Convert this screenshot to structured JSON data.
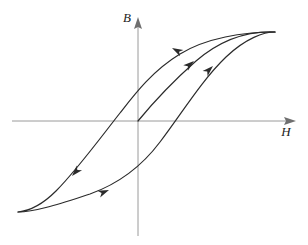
{
  "figure": {
    "kind": "diagram",
    "title_visible": false,
    "background_color": "#ffffff",
    "curve_color": "#2b2b2b",
    "axis_color": "#9a9a9a",
    "label_color": "#222222",
    "curve_width": 1.2,
    "axis_width": 1.0
  },
  "axes": {
    "origin": {
      "x": 138,
      "y": 121
    },
    "horizontal": {
      "name": "H",
      "label": "H",
      "label_position": {
        "x": 286,
        "y": 135
      },
      "start": {
        "x": 12,
        "y": 121
      },
      "end": {
        "x": 296,
        "y": 121
      },
      "arrow_at": "end"
    },
    "vertical": {
      "name": "B",
      "label": "B",
      "label_position": {
        "x": 127,
        "y": 22
      },
      "start": {
        "x": 138,
        "y": 236
      },
      "end": {
        "x": 138,
        "y": 17
      },
      "arrow_at": "end"
    }
  },
  "chart_data": {
    "type": "line",
    "title": "",
    "xlabel": "H",
    "ylabel": "B",
    "grid": false,
    "legend": false,
    "saturation_points": {
      "positive": {
        "x": 275,
        "y": 32
      },
      "negative": {
        "x": 18,
        "y": 212
      }
    },
    "remanence_crossing_b_axis": {
      "x": 138,
      "y": 78
    },
    "coercivity_crossing_h_axis": {
      "x": 111,
      "y": 121
    },
    "ascending_crossing_h_axis": {
      "x": 166,
      "y": 121
    },
    "ascending_crossing_b_axis": {
      "x": 138,
      "y": 163
    },
    "series": [
      {
        "name": "initial-magnetization-curve",
        "path": "M 138 121 C 152 104, 170 84, 196 61 C 224 37, 253 31, 275 32"
      },
      {
        "name": "descending-branch",
        "path": "M 275 32 C 243 32, 206 38, 180 54 C 152 71, 134 95, 120 113 C 98 141, 76 171, 56 191 C 42 205, 28 211, 18 212"
      },
      {
        "name": "ascending-branch",
        "path": "M 18 212 C 36 212, 62 203, 90 194 C 118 184, 142 166, 160 142 C 182 113, 202 80, 226 57 C 246 38, 264 32, 275 32"
      }
    ],
    "arrows": [
      {
        "name": "arrow-descending-upper",
        "x": 172,
        "y": 48,
        "angle_deg": 208,
        "direction": "down-left"
      },
      {
        "name": "arrow-initial-curve",
        "x": 194,
        "y": 61,
        "angle_deg": -40,
        "direction": "up-right"
      },
      {
        "name": "arrow-ascending-upper",
        "x": 213,
        "y": 66,
        "angle_deg": -44,
        "direction": "up-right"
      },
      {
        "name": "arrow-descending-lower",
        "x": 72,
        "y": 176,
        "angle_deg": 132,
        "direction": "down-left"
      },
      {
        "name": "arrow-ascending-lower",
        "x": 109,
        "y": 190,
        "angle_deg": -22,
        "direction": "up-right"
      }
    ]
  }
}
